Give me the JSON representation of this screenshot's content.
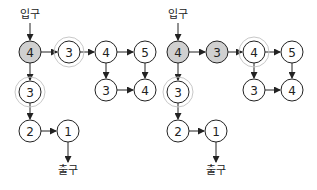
{
  "colors": {
    "visited_fill": "#d0d0d0",
    "default_fill": "#ffffff",
    "stroke": "#222222",
    "ring": "#c8c8c8"
  },
  "diagrams": [
    {
      "entry_label": "입구",
      "exit_label": "출구",
      "entry": {
        "x": 30,
        "y": 14
      },
      "exit": {
        "x": 68,
        "y": 170
      },
      "nodes": [
        {
          "id": "a",
          "value": "4",
          "x": 30,
          "y": 52,
          "filled": true,
          "ring": false
        },
        {
          "id": "b",
          "value": "3",
          "x": 69,
          "y": 52,
          "filled": false,
          "ring": true
        },
        {
          "id": "c",
          "value": "4",
          "x": 106,
          "y": 52,
          "filled": false,
          "ring": false
        },
        {
          "id": "d",
          "value": "5",
          "x": 145,
          "y": 52,
          "filled": false,
          "ring": false
        },
        {
          "id": "e",
          "value": "3",
          "x": 106,
          "y": 90,
          "filled": false,
          "ring": false
        },
        {
          "id": "f",
          "value": "4",
          "x": 145,
          "y": 90,
          "filled": false,
          "ring": false
        },
        {
          "id": "g",
          "value": "3",
          "x": 30,
          "y": 92,
          "filled": false,
          "ring": true
        },
        {
          "id": "h",
          "value": "2",
          "x": 30,
          "y": 131,
          "filled": false,
          "ring": false
        },
        {
          "id": "i",
          "value": "1",
          "x": 68,
          "y": 131,
          "filled": false,
          "ring": false
        }
      ],
      "edges": [
        [
          "a",
          "b"
        ],
        [
          "b",
          "c"
        ],
        [
          "c",
          "d"
        ],
        [
          "c",
          "e"
        ],
        [
          "d",
          "f"
        ],
        [
          "e",
          "f"
        ],
        [
          "a",
          "g"
        ],
        [
          "g",
          "h"
        ],
        [
          "h",
          "i"
        ]
      ]
    },
    {
      "entry_label": "입구",
      "exit_label": "출구",
      "entry": {
        "x": 178,
        "y": 14
      },
      "exit": {
        "x": 216,
        "y": 170
      },
      "nodes": [
        {
          "id": "a",
          "value": "4",
          "x": 178,
          "y": 52,
          "filled": true,
          "ring": false
        },
        {
          "id": "b",
          "value": "3",
          "x": 217,
          "y": 52,
          "filled": true,
          "ring": false
        },
        {
          "id": "c",
          "value": "4",
          "x": 254,
          "y": 52,
          "filled": false,
          "ring": true
        },
        {
          "id": "d",
          "value": "5",
          "x": 292,
          "y": 52,
          "filled": false,
          "ring": false
        },
        {
          "id": "e",
          "value": "3",
          "x": 254,
          "y": 90,
          "filled": false,
          "ring": false
        },
        {
          "id": "f",
          "value": "4",
          "x": 292,
          "y": 90,
          "filled": false,
          "ring": false
        },
        {
          "id": "g",
          "value": "3",
          "x": 178,
          "y": 92,
          "filled": false,
          "ring": true
        },
        {
          "id": "h",
          "value": "2",
          "x": 178,
          "y": 131,
          "filled": false,
          "ring": false
        },
        {
          "id": "i",
          "value": "1",
          "x": 216,
          "y": 131,
          "filled": false,
          "ring": false
        }
      ],
      "edges": [
        [
          "a",
          "b"
        ],
        [
          "b",
          "c"
        ],
        [
          "c",
          "d"
        ],
        [
          "c",
          "e"
        ],
        [
          "d",
          "f"
        ],
        [
          "e",
          "f"
        ],
        [
          "a",
          "g"
        ],
        [
          "g",
          "h"
        ],
        [
          "h",
          "i"
        ]
      ]
    }
  ]
}
